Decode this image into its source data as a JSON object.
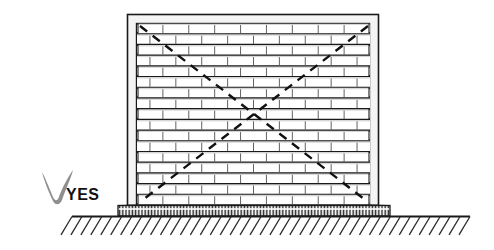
{
  "illustration": {
    "title": "Masonry infill wall braced within frame - correct detail",
    "verdict": {
      "label": "YES",
      "check_icon": "check-mark-icon",
      "check_color": "#8f8f8f",
      "text_color": "#111111"
    },
    "colors": {
      "ink": "#1a1a1a",
      "brick_fill": "#ffffff",
      "brick_shadow": "#d9d9d9",
      "frame_fill": "#f2f2f2",
      "ground_line": "#222222",
      "hatch": "#333333"
    },
    "frame": {
      "name": "structural-frame",
      "x": 127,
      "y": 14,
      "width": 252,
      "height": 192,
      "post_width": 9,
      "beam_height": 9
    },
    "wall": {
      "name": "brick-infill-wall",
      "x": 137,
      "y": 23,
      "width": 233,
      "height": 182,
      "courses": 17,
      "course_height": 10.7,
      "bricks_per_course": 9,
      "toothing": "stepped-interlock-both-sides"
    },
    "bracing": {
      "name": "diagonal-bracing",
      "style": "dashed",
      "dash_pattern": "9 7",
      "stroke_width": 2.4,
      "lines": [
        {
          "from": [
            140,
            26
          ],
          "to": [
            368,
            202
          ]
        },
        {
          "from": [
            368,
            26
          ],
          "to": [
            140,
            202
          ]
        }
      ],
      "crossing_point": [
        254,
        114
      ]
    },
    "footing": {
      "name": "foundation-footing",
      "x": 118,
      "y": 205,
      "width": 272,
      "height": 11,
      "hatch": "dense-vertical"
    },
    "ground": {
      "name": "ground-line",
      "x1": 72,
      "x2": 470,
      "y": 216,
      "hatch_angle": -60,
      "hatch_count": 40,
      "hatch_length": 22
    }
  }
}
